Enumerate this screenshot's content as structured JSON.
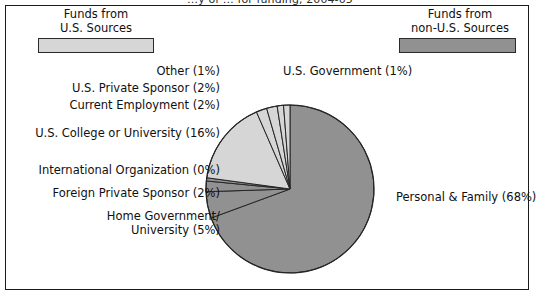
{
  "top_clipped_title": "…y of … for funding, 2004-05",
  "frame": {
    "border_color": "#1b1b1b",
    "background": "#ffffff"
  },
  "legend": {
    "left": {
      "line1": "Funds from",
      "line2": "U.S. Sources",
      "swatch_color": "#d6d6d6",
      "swatch_name": "us-sources-swatch"
    },
    "right": {
      "line1": "Funds from",
      "line2": "non-U.S. Sources",
      "swatch_color": "#919191",
      "swatch_name": "non-us-sources-swatch"
    }
  },
  "labels": {
    "other": "Other (1%)",
    "us_government": "U.S. Government (1%)",
    "us_private_sponsor": "U.S. Private Sponsor (2%)",
    "current_employment": "Current Employment (2%)",
    "us_college": "U.S. College or University (16%)",
    "international_organization": "International Organization (0%)",
    "foreign_private_sponsor": "Foreign Private Sponsor (2%)",
    "home_government_line1": "Home Government/",
    "home_government_line2": "University (5%)",
    "personal_family": "Personal & Family (68%)"
  },
  "chart_data": {
    "type": "pie",
    "title": "",
    "legend_position": "top",
    "start_angle_deg": 0,
    "direction": "clockwise",
    "center": {
      "x": 290,
      "y": 189
    },
    "radius": 84,
    "colors": {
      "us_sources": "#d6d6d6",
      "non_us_sources": "#919191",
      "slice_outline": "#262626"
    },
    "categories": [
      "Personal & Family",
      "Home Government/University",
      "Foreign Private Sponsor",
      "International Organization",
      "U.S. College or University",
      "Current Employment",
      "U.S. Private Sponsor",
      "Other",
      "U.S. Government"
    ],
    "values": [
      68,
      5,
      2,
      0,
      16,
      2,
      2,
      1,
      1
    ],
    "value_labels": [
      "68%",
      "5%",
      "2%",
      "0%",
      "16%",
      "2%",
      "2%",
      "1%",
      "1%"
    ],
    "funding_source": [
      "non-U.S.",
      "non-U.S.",
      "non-U.S.",
      "non-U.S.",
      "U.S.",
      "U.S.",
      "U.S.",
      "U.S.",
      "U.S."
    ],
    "slices": [
      {
        "name": "Personal & Family",
        "value": 68,
        "label": "Personal & Family (68%)",
        "color": "#919191",
        "source": "non-U.S."
      },
      {
        "name": "Home Government/University",
        "value": 5,
        "label": "Home Government/University (5%)",
        "color": "#919191",
        "source": "non-U.S."
      },
      {
        "name": "Foreign Private Sponsor",
        "value": 2,
        "label": "Foreign Private Sponsor (2%)",
        "color": "#919191",
        "source": "non-U.S."
      },
      {
        "name": "International Organization",
        "value": 0.6,
        "label": "International Organization (0%)",
        "color": "#919191",
        "source": "non-U.S."
      },
      {
        "name": "U.S. College or University",
        "value": 16,
        "label": "U.S. College or University (16%)",
        "color": "#d6d6d6",
        "source": "U.S."
      },
      {
        "name": "Current Employment",
        "value": 2,
        "label": "Current Employment (2%)",
        "color": "#d6d6d6",
        "source": "U.S."
      },
      {
        "name": "U.S. Private Sponsor",
        "value": 2,
        "label": "U.S. Private Sponsor (2%)",
        "color": "#d6d6d6",
        "source": "U.S."
      },
      {
        "name": "Other",
        "value": 1.2,
        "label": "Other (1%)",
        "color": "#d6d6d6",
        "source": "U.S."
      },
      {
        "name": "U.S. Government",
        "value": 1.2,
        "label": "U.S. Government (1%)",
        "color": "#d6d6d6",
        "source": "U.S."
      }
    ],
    "xlabel": "",
    "ylabel": ""
  }
}
